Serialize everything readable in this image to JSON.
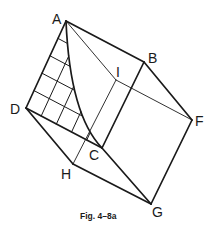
{
  "figure": {
    "caption": "Fig. 4–8a",
    "vertices": {
      "A": {
        "label": "A",
        "x": 66,
        "y": 21
      },
      "B": {
        "label": "B",
        "x": 144,
        "y": 62
      },
      "C": {
        "label": "C",
        "x": 102,
        "y": 148
      },
      "D": {
        "label": "D",
        "x": 26,
        "y": 108
      },
      "F": {
        "label": "F",
        "x": 192,
        "y": 120
      },
      "G": {
        "label": "G",
        "x": 151,
        "y": 204
      },
      "H": {
        "label": "H",
        "x": 73,
        "y": 164
      },
      "I": {
        "label": "I",
        "x": 116,
        "y": 80
      }
    },
    "edges_visible": [
      "A-B",
      "B-F",
      "F-G",
      "G-C",
      "C-B",
      "D-C",
      "D-H",
      "H-G",
      "A-D"
    ],
    "edges_hidden_thin": [
      "A-I",
      "I-F",
      "I-H"
    ],
    "curved_edge": "A-C",
    "hatch_grid_divisions": 5,
    "stroke_color": "#1a1a1a",
    "background_color": "#ffffff"
  }
}
